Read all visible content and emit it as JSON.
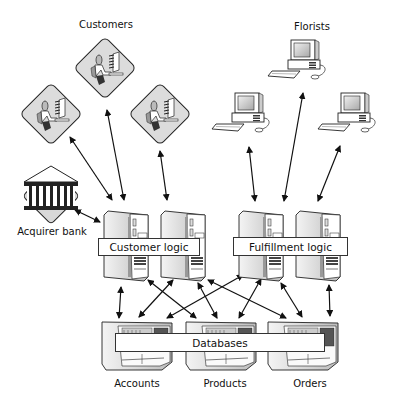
{
  "groups": {
    "customers": {
      "label": "Customers",
      "count": 3
    },
    "florists": {
      "label": "Florists",
      "count": 3
    },
    "acquirer_bank": {
      "label": "Acquirer bank"
    }
  },
  "tiers": {
    "customer_logic": {
      "label": "Customer logic",
      "servers": 2
    },
    "fulfillment_logic": {
      "label": "Fulfillment logic",
      "servers": 2
    },
    "databases": {
      "label": "Databases",
      "items": [
        "Accounts",
        "Products",
        "Orders"
      ]
    }
  },
  "connections": [
    {
      "from": "customer-1",
      "to": "customer-logic-server-1",
      "type": "bidirectional"
    },
    {
      "from": "customer-2",
      "to": "customer-logic-server-1",
      "type": "bidirectional"
    },
    {
      "from": "customer-3",
      "to": "customer-logic-server-2",
      "type": "bidirectional"
    },
    {
      "from": "acquirer-bank",
      "to": "customer-logic-server-1",
      "type": "bidirectional"
    },
    {
      "from": "florist-1",
      "to": "fulfillment-logic-server-1",
      "type": "bidirectional"
    },
    {
      "from": "florist-2",
      "to": "fulfillment-logic-server-1",
      "type": "bidirectional"
    },
    {
      "from": "florist-3",
      "to": "fulfillment-logic-server-2",
      "type": "bidirectional"
    },
    {
      "from": "customer-logic",
      "to": "accounts",
      "type": "bidirectional"
    },
    {
      "from": "customer-logic",
      "to": "products",
      "type": "bidirectional"
    },
    {
      "from": "customer-logic",
      "to": "orders",
      "type": "bidirectional"
    },
    {
      "from": "fulfillment-logic",
      "to": "accounts",
      "type": "bidirectional"
    },
    {
      "from": "fulfillment-logic",
      "to": "products",
      "type": "bidirectional"
    },
    {
      "from": "fulfillment-logic",
      "to": "orders",
      "type": "bidirectional"
    }
  ],
  "colors": {
    "line": "#111111",
    "fill_light": "#e6e6e6",
    "fill_mid": "#bdbdbd",
    "fill_dark": "#3a3a3a"
  }
}
